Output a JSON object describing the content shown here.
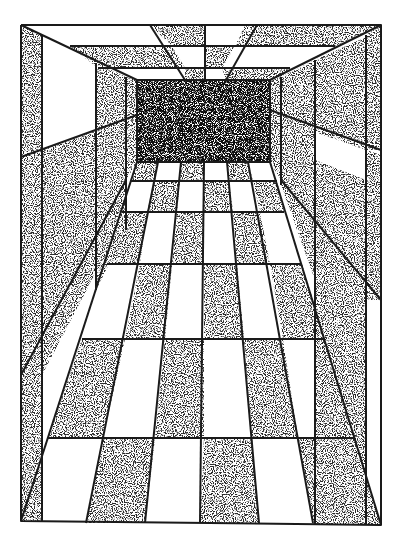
{
  "colors": {
    "paper": "#ffffff",
    "ink": "#1a1a1a",
    "stipple_light": "#8a8a8a",
    "stipple_dark": "#3a3a3a"
  },
  "geometry": {
    "outer_frame": {
      "x1": 21,
      "y1": 25,
      "x2": 381,
      "y2": 524
    },
    "back_wall": {
      "x1": 137,
      "y1": 80,
      "x2": 270,
      "y2": 162
    },
    "vanishing_point": {
      "x": 204,
      "y": 121
    }
  },
  "floor": {
    "columns": 6,
    "rows": 6,
    "pattern_note": "checkerboard; row nearest back wall starts dark"
  },
  "ceiling": {
    "bands": 3
  }
}
